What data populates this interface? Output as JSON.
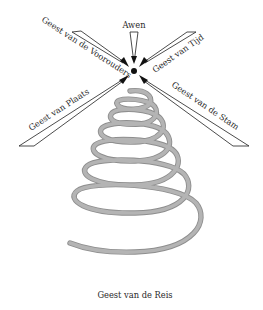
{
  "diagram": {
    "center": {
      "label": "Awen"
    },
    "spirits": [
      {
        "id": "voorouders",
        "label": "Geest van de Voorouders",
        "position": "upper-left"
      },
      {
        "id": "tijd",
        "label": "Geest van Tijd",
        "position": "upper-right"
      },
      {
        "id": "plaats",
        "label": "Geest van Plaats",
        "position": "lower-left"
      },
      {
        "id": "stam",
        "label": "Geest van de Stam",
        "position": "lower-right"
      }
    ],
    "spiral": {
      "label": "Geest van de Reis"
    }
  },
  "colors": {
    "ink": "#1e1e1e",
    "spiral": "#a8a8a8",
    "background": "#ffffff"
  }
}
